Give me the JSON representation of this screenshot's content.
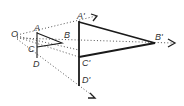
{
  "diagram": {
    "type": "homothety",
    "center": {
      "label": "O",
      "x": 17,
      "y": 35
    },
    "small_figure": {
      "A": {
        "label": "A",
        "x": 37,
        "y": 33
      },
      "B": {
        "label": "B",
        "x": 62,
        "y": 43
      },
      "C": {
        "label": "C",
        "x": 37,
        "y": 47
      },
      "D": {
        "label": "D",
        "x": 37,
        "y": 58
      }
    },
    "large_figure": {
      "A": {
        "label": "A'",
        "x": 79,
        "y": 22
      },
      "B": {
        "label": "B'",
        "x": 155,
        "y": 43
      },
      "C": {
        "label": "C'",
        "x": 79,
        "y": 57
      },
      "D": {
        "label": "D'",
        "x": 79,
        "y": 85
      }
    },
    "colors": {
      "line": "#1a1a1a",
      "dotted": "#555555",
      "label": "#333333"
    }
  }
}
